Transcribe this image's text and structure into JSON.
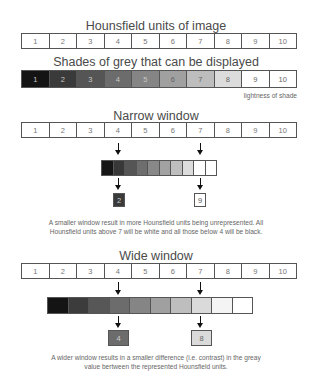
{
  "hounsfield": {
    "title": "Hounsfield units of image",
    "cells": [
      "1",
      "2",
      "3",
      "4",
      "5",
      "6",
      "7",
      "8",
      "9",
      "10"
    ]
  },
  "shades": {
    "title": "Shades of grey that can be displayed",
    "cells": [
      "1",
      "2",
      "3",
      "4",
      "5",
      "6",
      "7",
      "8",
      "9",
      "10"
    ],
    "colors": [
      "#141414",
      "#3a3a3a",
      "#555555",
      "#6c6c6c",
      "#858585",
      "#a0a0a0",
      "#bdbdbd",
      "#dcdcdc",
      "#ffffff",
      "#ffffff"
    ],
    "caption": "lightness of shade"
  },
  "narrow": {
    "title": "Narrow window",
    "cells": [
      "1",
      "2",
      "3",
      "4",
      "5",
      "6",
      "7",
      "8",
      "9",
      "10"
    ],
    "arrow_from": [
      "4",
      "7"
    ],
    "bar_colors": [
      "#161616",
      "#383838",
      "#555555",
      "#6e6e6e",
      "#888888",
      "#a2a2a2",
      "#bebebe",
      "#dcdcdc",
      "#ffffff",
      "#ffffff"
    ],
    "results": [
      {
        "label": "2",
        "color": "#3a3a3a",
        "text_color": "#cccccc"
      },
      {
        "label": "9",
        "color": "#ffffff",
        "text_color": "#555555"
      }
    ],
    "description_line1": "A smaller window result in more Hounsfield units being unrepresented. All",
    "description_line2": "Hounsfield units above 7 will be white and all those below 4 will be black."
  },
  "wide": {
    "title": "Wide window",
    "cells": [
      "1",
      "2",
      "3",
      "4",
      "5",
      "6",
      "7",
      "8",
      "9",
      "10"
    ],
    "arrow_from": [
      "4",
      "7"
    ],
    "bar_colors": [
      "#141414",
      "#3c3c3c",
      "#575757",
      "#6c6c6c",
      "#858585",
      "#a0a0a0",
      "#bebebe",
      "#dadada",
      "#f4f4f4",
      "#ffffff"
    ],
    "results": [
      {
        "label": "4",
        "color": "#6c6c6c",
        "text_color": "#d0d0d0"
      },
      {
        "label": "8",
        "color": "#dadada",
        "text_color": "#666666"
      }
    ],
    "description_line1": "A wider window results in a smaller difference (i.e. contrast) in the greay",
    "description_line2": "value bertween the represented Hounsfield units."
  }
}
